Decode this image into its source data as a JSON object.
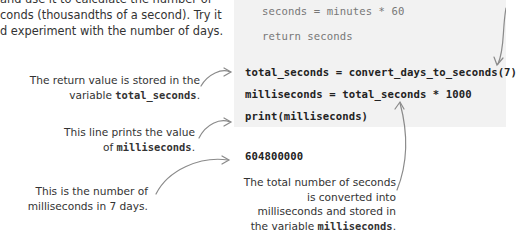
{
  "intro": {
    "lines": [
      "and use it to calculate the number of",
      "conds (thousandths of a second). Try it",
      "d experiment with the number of days."
    ]
  },
  "code": {
    "function_lines": [
      "seconds = minutes * 60",
      "return seconds"
    ],
    "main_lines": [
      "total_seconds = convert_days_to_seconds(7)",
      "milliseconds = total_seconds * 1000",
      "print(milliseconds)"
    ],
    "output": "604800000"
  },
  "annotations": {
    "return_value": {
      "line1": "The return value is stored in the",
      "line2_prefix": "variable ",
      "line2_code": "total_seconds",
      "line2_suffix": "."
    },
    "print_line": {
      "line1": "This line prints the value",
      "line2_prefix": "of ",
      "line2_code": "milliseconds",
      "line2_suffix": "."
    },
    "output_note": {
      "line1": "This is the number of",
      "line2": "milliseconds in 7 days."
    },
    "conversion": {
      "line1": "The total number of seconds",
      "line2": "is converted into",
      "line3": "milliseconds and stored in",
      "line4_prefix": "the variable ",
      "line4_code": "milliseconds",
      "line4_suffix": "."
    }
  },
  "colors": {
    "code_background": "#f2f2f2",
    "arrow": "#8a8a8a",
    "text": "#333333"
  }
}
